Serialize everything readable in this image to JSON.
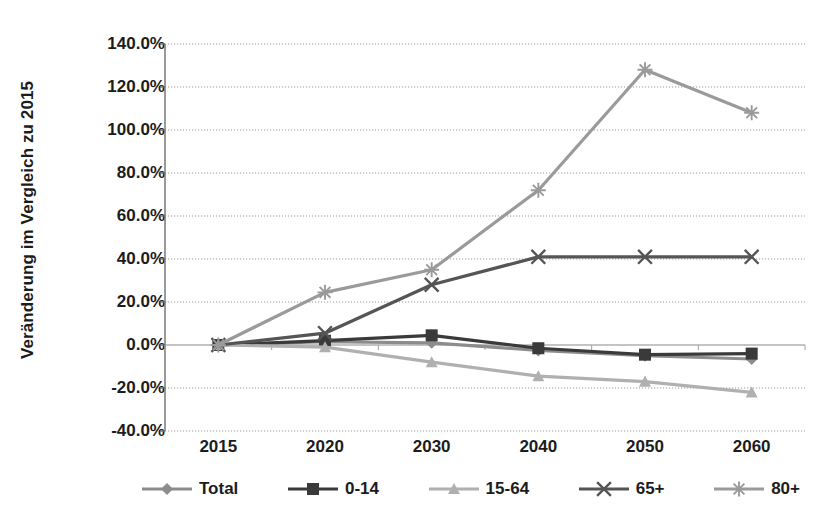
{
  "chart_data": {
    "type": "line",
    "title": "",
    "xlabel": "",
    "ylabel": "Veränderung im Vergleich zu 2015",
    "categories": [
      "2015",
      "2020",
      "2030",
      "2040",
      "2050",
      "2060"
    ],
    "x": [
      2015,
      2020,
      2030,
      2040,
      2050,
      2060
    ],
    "ylim": [
      -40,
      140
    ],
    "ytick_values": [
      140,
      120,
      100,
      80,
      60,
      40,
      20,
      0,
      -20,
      -40
    ],
    "ytick_labels": [
      "140.0%",
      "120.0%",
      "100.0%",
      "80.0%",
      "60.0%",
      "40.0%",
      "20.0%",
      "0.0%",
      "-20.0%",
      "-40.0%"
    ],
    "grid": true,
    "legend_position": "bottom",
    "series": [
      {
        "name": "Total",
        "marker": "diamond",
        "color": "#8c8c8c",
        "values": [
          0.0,
          1.5,
          1.0,
          -2.5,
          -5.0,
          -6.5
        ]
      },
      {
        "name": "0-14",
        "marker": "square",
        "color": "#3a3a3a",
        "values": [
          0.0,
          2.0,
          4.5,
          -1.5,
          -4.5,
          -4.0
        ]
      },
      {
        "name": "15-64",
        "marker": "triangle",
        "color": "#b0b0b0",
        "values": [
          0.0,
          -1.0,
          -8.0,
          -14.5,
          -17.0,
          -22.0
        ]
      },
      {
        "name": "65+",
        "marker": "x",
        "color": "#555555",
        "values": [
          0.0,
          5.5,
          28.0,
          41.0,
          41.0,
          41.0
        ]
      },
      {
        "name": "80+",
        "marker": "asterisk",
        "color": "#9a9a9a",
        "values": [
          0.0,
          24.5,
          35.0,
          72.0,
          128.0,
          108.0
        ]
      }
    ]
  },
  "legend": {
    "items": [
      {
        "label": "Total"
      },
      {
        "label": "0-14"
      },
      {
        "label": "15-64"
      },
      {
        "label": "65+"
      },
      {
        "label": "80+"
      }
    ]
  }
}
